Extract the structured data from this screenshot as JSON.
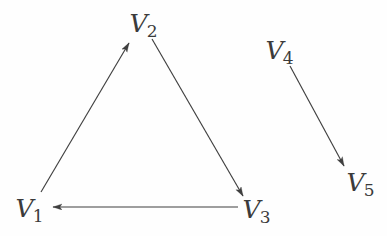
{
  "figure": {
    "width": 387,
    "height": 236,
    "background_color": "#fefefe",
    "stroke_color": "#3f3f3f",
    "label_color": "#3b3b3b"
  },
  "graph_data": {
    "type": "diagram",
    "diagram_kind": "directed-graph",
    "description": "Directed graph with five vertices: a 3-cycle on V1, V2, V3 and a separate single edge from V4 to V5.",
    "node_count": 5,
    "edge_count": 4,
    "directed": true,
    "nodes": [
      {
        "id": "V1",
        "letter": "V",
        "subscript": "1",
        "label": "V1",
        "x": 30,
        "y": 208
      },
      {
        "id": "V2",
        "letter": "V",
        "subscript": "2",
        "label": "V2",
        "x": 144,
        "y": 23
      },
      {
        "id": "V3",
        "letter": "V",
        "subscript": "3",
        "label": "V3",
        "x": 257,
        "y": 209
      },
      {
        "id": "V4",
        "letter": "V",
        "subscript": "4",
        "label": "V4",
        "x": 280,
        "y": 50
      },
      {
        "id": "V5",
        "letter": "V",
        "subscript": "5",
        "label": "V5",
        "x": 361,
        "y": 182
      }
    ],
    "edges": [
      {
        "id": "e1",
        "from": "V1",
        "to": "V2",
        "x1": 41,
        "y1": 192,
        "x2": 129,
        "y2": 43,
        "arrow_at": "to"
      },
      {
        "id": "e2",
        "from": "V2",
        "to": "V3",
        "x1": 152,
        "y1": 39,
        "x2": 243,
        "y2": 196,
        "arrow_at": "to"
      },
      {
        "id": "e3",
        "from": "V3",
        "to": "V1",
        "x1": 238,
        "y1": 207,
        "x2": 53,
        "y2": 207,
        "arrow_at": "to"
      },
      {
        "id": "e4",
        "from": "V4",
        "to": "V5",
        "x1": 290,
        "y1": 66,
        "x2": 344,
        "y2": 166,
        "arrow_at": "to"
      }
    ],
    "components": [
      {
        "name": "cycle",
        "nodes": [
          "V1",
          "V2",
          "V3"
        ]
      },
      {
        "name": "single-edge",
        "nodes": [
          "V4",
          "V5"
        ]
      }
    ]
  }
}
